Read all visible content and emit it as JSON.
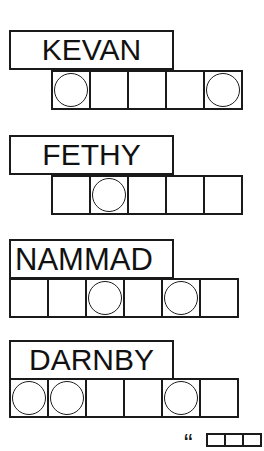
{
  "puzzle": {
    "type": "word-jumble",
    "words": [
      {
        "scrambled": "KEVAN",
        "cells": 5,
        "circled": [
          0,
          4
        ]
      },
      {
        "scrambled": "FETHY",
        "cells": 5,
        "circled": [
          1
        ]
      },
      {
        "scrambled": "NAMMAD",
        "cells": 6,
        "circled": [
          2,
          4
        ]
      },
      {
        "scrambled": "DARNBY",
        "cells": 6,
        "circled": [
          0,
          1,
          4
        ]
      }
    ],
    "answer": {
      "open_quote": "“"
    }
  }
}
